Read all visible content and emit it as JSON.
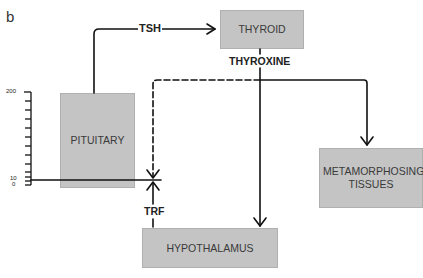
{
  "figure": {
    "panel_label": "b",
    "nodes": {
      "thyroid": "THYROID",
      "pituitary": "PITUITARY",
      "hypothalamus": "HYPOTHALAMUS",
      "metamorphosing": "METAMORPHOSING TISSUES"
    },
    "edges": {
      "tsh": "TSH",
      "thyroxine": "THYROXINE",
      "trf": "TRF"
    },
    "scale": {
      "top_label": "200",
      "mid_label": "10",
      "bottom_label": "0"
    },
    "colors": {
      "box_fill": "#c4c4c4",
      "line": "#111111"
    }
  }
}
